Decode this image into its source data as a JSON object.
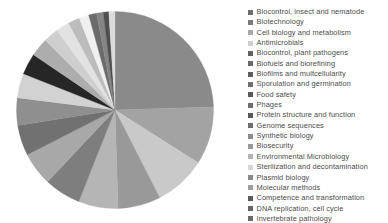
{
  "chart_data": {
    "type": "pie",
    "title": "",
    "subtitle": "",
    "xlabel": "",
    "ylabel": "",
    "legend_position": "right",
    "grid": false,
    "start_angle_deg": 0,
    "direction": "clockwise",
    "categories": [
      "Biocontrol, insect and nematode",
      "Biotechnology",
      "Cell biology and metabolism",
      "Antimicrobials",
      "Biocontrol, plant pathogens",
      "Biofuels and biorefining",
      "Biofilms and multcellularity",
      "Sporulation and germination",
      "Food safety",
      "Phages",
      "Protein structure and function",
      "Genome sequences",
      "Synthetic biology",
      "Biosecurity",
      "Environmental Microbiology",
      "Sterilization and decontamination",
      "Plasmid biology",
      "Molecular methods",
      "Competence and transformation",
      "DNA replication, cell cycle"
    ],
    "values": [
      24.5,
      9.5,
      8.5,
      7.0,
      6.5,
      6.0,
      5.5,
      5.0,
      4.5,
      4.0,
      3.5,
      3.0,
      2.5,
      2.2,
      1.9,
      1.6,
      1.3,
      1.1,
      0.9,
      1.0
    ],
    "colors": [
      "#8a8a8a",
      "#a3a3a3",
      "#c9c9c9",
      "#999999",
      "#b5b5b5",
      "#7e7e7e",
      "#a8a8a8",
      "#717171",
      "#8f8f8f",
      "#d2d2d2",
      "#262626",
      "#adadad",
      "#cfcfcf",
      "#e2e2e2",
      "#bcbcbc",
      "#f0f0f0",
      "#6b6b6b",
      "#858585",
      "#4f4f4f",
      "#dcdcdc"
    ]
  },
  "legend": {
    "entries": [
      {
        "label": "Biocontrol, insect and nematode",
        "color": "#6d6d6d"
      },
      {
        "label": "Biotechnology",
        "color": "#7a7a7a"
      },
      {
        "label": "Cell biology and metabolism",
        "color": "#a8a8a8"
      },
      {
        "label": "Antimicrobials",
        "color": "#cfcfcf"
      },
      {
        "label": "Biocontrol, plant pathogens",
        "color": "#616161"
      },
      {
        "label": "Biofuels and biorefining",
        "color": "#6a6a6a"
      },
      {
        "label": "Biofilms and multcellularity",
        "color": "#5e5e5e"
      },
      {
        "label": "Sporulation and germination",
        "color": "#707070"
      },
      {
        "label": "Food safety",
        "color": "#5a5a5a"
      },
      {
        "label": "Phages",
        "color": "#6e6e6e"
      },
      {
        "label": "Protein structure and function",
        "color": "#585858"
      },
      {
        "label": "Genome sequences",
        "color": "#6c6c6c"
      },
      {
        "label": "Synthetic biology",
        "color": "#8d8d8d"
      },
      {
        "label": "Biosecurity",
        "color": "#9a9a9a"
      },
      {
        "label": "Environmental Microbiology",
        "color": "#b4b4b4"
      },
      {
        "label": "Sterilization and decontamination",
        "color": "#d6d6d6"
      },
      {
        "label": "Plasmid biology",
        "color": "#8a8a8a"
      },
      {
        "label": "Molecular methods",
        "color": "#9e9e9e"
      },
      {
        "label": "Competence and transformation",
        "color": "#5c5c5c"
      },
      {
        "label": "DNA replication, cell cycle",
        "color": "#666666"
      },
      {
        "label": "Invertebrate pathology",
        "color": "#6b6b6b"
      }
    ]
  },
  "style": {
    "background": "#ffffff",
    "legend_text_color": "#4c4c4c"
  }
}
